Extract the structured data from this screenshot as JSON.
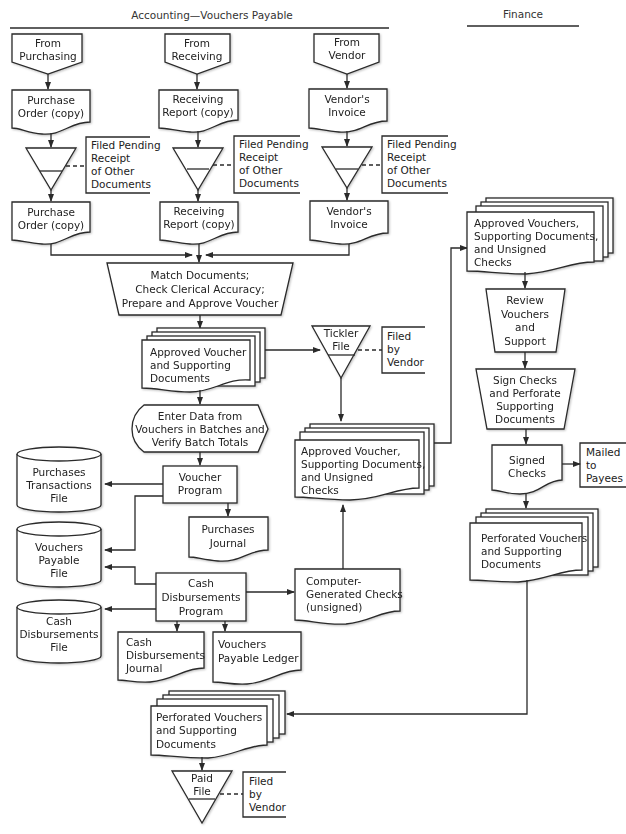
{
  "headers": {
    "accounting": "Accounting—Vouchers Payable",
    "finance": "Finance"
  },
  "sources": [
    {
      "line1": "From",
      "line2": "Purchasing"
    },
    {
      "line1": "From",
      "line2": "Receiving"
    },
    {
      "line1": "From",
      "line2": "Vendor"
    }
  ],
  "incoming_docs": [
    {
      "line1": "Purchase",
      "line2": "Order (copy)"
    },
    {
      "line1": "Receiving",
      "line2": "Report (copy)"
    },
    {
      "line1": "Vendor's",
      "line2": "Invoice"
    }
  ],
  "pending_note": {
    "line1": "Filed Pending",
    "line2": "Receipt",
    "line3": "of Other",
    "line4": "Documents"
  },
  "match_process": {
    "line1": "Match Documents;",
    "line2": "Check Clerical Accuracy;",
    "line3": "Prepare and Approve Voucher"
  },
  "approved_voucher": {
    "line1": "Approved Voucher",
    "line2": "and Supporting",
    "line3": "Documents"
  },
  "tickler_file": {
    "line1": "Tickler",
    "line2": "File"
  },
  "filed_by_vendor": {
    "line1": "Filed",
    "line2": "by",
    "line3": "Vendor"
  },
  "enter_data": {
    "line1": "Enter Data from",
    "line2": "Vouchers in Batches and",
    "line3": "Verify Batch Totals"
  },
  "purchases_txn_file": {
    "line1": "Purchases",
    "line2": "Transactions",
    "line3": "File"
  },
  "voucher_program": {
    "line1": "Voucher",
    "line2": "Program"
  },
  "purchases_journal": {
    "line1": "Purchases",
    "line2": "Journal"
  },
  "vouchers_payable_file": {
    "line1": "Vouchers",
    "line2": "Payable",
    "line3": "File"
  },
  "cash_disb_program": {
    "line1": "Cash",
    "line2": "Disbursements",
    "line3": "Program"
  },
  "cash_disb_file": {
    "line1": "Cash",
    "line2": "Disbursements",
    "line3": "File"
  },
  "cash_disb_journal": {
    "line1": "Cash",
    "line2": "Disbursements",
    "line3": "Journal"
  },
  "vp_ledger": {
    "line1": "Vouchers",
    "line2": "Payable Ledger"
  },
  "computer_checks": {
    "line1": "Computer-",
    "line2": "Generated Checks",
    "line3": "(unsigned)"
  },
  "approved_unsigned": {
    "line1": "Approved Voucher,",
    "line2": "Supporting Documents,",
    "line3": "and Unsigned",
    "line4": "Checks"
  },
  "finance_approved": {
    "line1": "Approved Vouchers,",
    "line2": "Supporting Documents,",
    "line3": "and Unsigned",
    "line4": "Checks"
  },
  "review": {
    "line1": "Review",
    "line2": "Vouchers",
    "line3": "and",
    "line4": "Support"
  },
  "sign_checks": {
    "line1": "Sign Checks",
    "line2": "and Perforate",
    "line3": "Supporting",
    "line4": "Documents"
  },
  "signed_checks": {
    "line1": "Signed",
    "line2": "Checks"
  },
  "mailed": {
    "line1": "Mailed",
    "line2": "to",
    "line3": "Payees"
  },
  "finance_perforated": {
    "line1": "Perforated Vouchers",
    "line2": "and Supporting",
    "line3": "Documents"
  },
  "perforated_return": {
    "line1": "Perforated Vouchers",
    "line2": "and Supporting",
    "line3": "Documents"
  },
  "paid_file": {
    "line1": "Paid",
    "line2": "File"
  },
  "paid_filed_by_vendor": {
    "line1": "Filed",
    "line2": "by",
    "line3": "Vendor"
  }
}
